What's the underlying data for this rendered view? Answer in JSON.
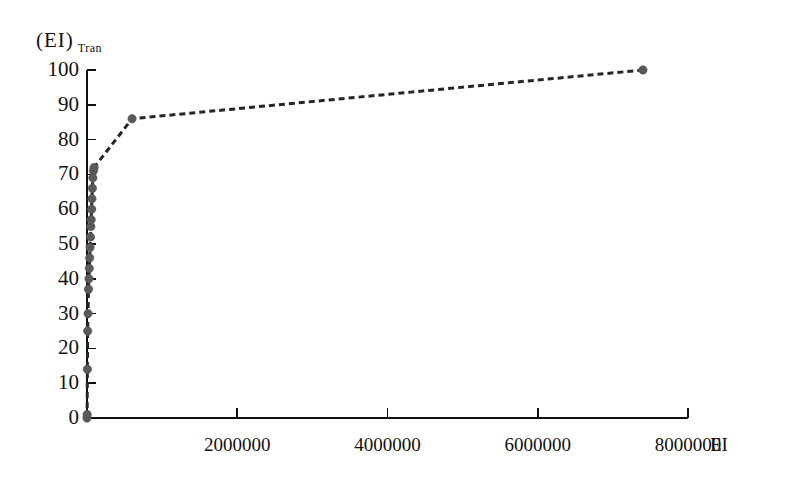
{
  "chart_data": {
    "type": "line",
    "title": "",
    "subtitle": "",
    "xlabel": "EI",
    "ylabel": "(EI)",
    "ylabel_sub": "Tran",
    "xlim": [
      0,
      8000000
    ],
    "ylim": [
      0,
      100
    ],
    "grid": false,
    "legend": "none",
    "line_style": "dashed",
    "marker": "filled-circle",
    "x_ticks": [
      {
        "value": 2000000,
        "label": "2000000"
      },
      {
        "value": 4000000,
        "label": "4000000"
      },
      {
        "value": 6000000,
        "label": "6000000"
      },
      {
        "value": 8000000,
        "label": "8000000"
      }
    ],
    "y_ticks": [
      {
        "value": 100,
        "label": "100"
      },
      {
        "value": 90,
        "label": "90"
      },
      {
        "value": 80,
        "label": "80"
      },
      {
        "value": 70,
        "label": "70"
      },
      {
        "value": 60,
        "label": "60"
      },
      {
        "value": 50,
        "label": "50"
      },
      {
        "value": 40,
        "label": "40"
      },
      {
        "value": 30,
        "label": "30"
      },
      {
        "value": 20,
        "label": "20"
      },
      {
        "value": 10,
        "label": "10"
      },
      {
        "value": 0,
        "label": "0"
      }
    ],
    "series": [
      {
        "name": "cumulative-EI-transfer",
        "color": "#262626",
        "marker_color": "#595959",
        "x": [
          0,
          2000,
          5000,
          9000,
          14000,
          20000,
          26000,
          31000,
          36000,
          41000,
          46000,
          51000,
          56000,
          61000,
          66000,
          72000,
          78000,
          85000,
          95000,
          600000,
          7400000
        ],
        "y": [
          0,
          1,
          14,
          25,
          30,
          37,
          40,
          43,
          46,
          49,
          52,
          55,
          57,
          60,
          63,
          66,
          69,
          71,
          72,
          86,
          100
        ]
      }
    ]
  },
  "axis": {
    "y_axis_name": "y-axis",
    "x_axis_name": "x-axis"
  }
}
